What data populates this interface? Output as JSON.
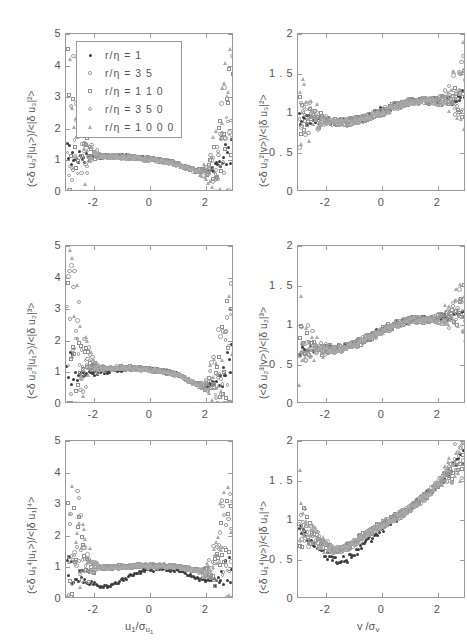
{
  "figure": {
    "title": "",
    "layout": "3 rows x 2 columns of scatter panels",
    "legend": {
      "position": "top-left panel, upper-left inside axes",
      "entries": [
        {
          "label": "r/η = 1",
          "marker": "filled-dot",
          "r_over_eta": 1
        },
        {
          "label": "r/η = 3 5",
          "marker": "small-circle",
          "r_over_eta": 35
        },
        {
          "label": "r/η = 1 1 0",
          "marker": "square",
          "r_over_eta": 110
        },
        {
          "label": "r/η = 3 5 0",
          "marker": "circle",
          "r_over_eta": 350
        },
        {
          "label": "r/η = 1 0 0 0",
          "marker": "triangle",
          "r_over_eta": 1000
        }
      ]
    },
    "colors": {
      "axis": "#9a9a9a",
      "text": "#555555",
      "series_1": "#3d3d3d",
      "series_35": "#8d8d8d",
      "series_110": "#909090",
      "series_350": "#a0a0a0",
      "series_1000": "#a8a8a8",
      "background": "#ffffff"
    }
  },
  "chart_data": [
    {
      "id": "panel-top-left",
      "type": "scatter",
      "title": "",
      "xlabel": "u₁/σ_u₁",
      "ylabel": "(<δ u₃²|u₁>)/<|δ u₃|²>",
      "xlim": [
        -3,
        3
      ],
      "ylim": [
        0,
        5
      ],
      "xticks": [
        -2,
        0,
        2
      ],
      "xticklabels": [
        "-2",
        "0",
        "2"
      ],
      "yticks": [
        0,
        1,
        2,
        3,
        4,
        5
      ],
      "yticklabels": [
        "0",
        "1",
        "2",
        "3",
        "4",
        "5"
      ],
      "grid": false,
      "description": "Flat near 1 across the core, dip to ~0.7 near x=2, upturn at both extreme tails."
    },
    {
      "id": "panel-top-right",
      "type": "scatter",
      "title": "",
      "xlabel": "v/σ_v",
      "ylabel": "(<δ u₃²|v>)/<|δ u₃|²>",
      "xlim": [
        -3,
        3
      ],
      "ylim": [
        0,
        2
      ],
      "xticks": [
        -2,
        0,
        2
      ],
      "xticklabels": [
        "-2",
        "0",
        "2"
      ],
      "yticks": [
        0,
        0.5,
        1,
        1.5,
        2
      ],
      "yticklabels": [
        "0",
        "0 . 5",
        "1",
        "1 . 5",
        "2"
      ],
      "grid": false,
      "description": "Monotonic rise from ~0.8 at x=-3 to ~1.4 at x=3."
    },
    {
      "id": "panel-middle-left",
      "type": "scatter",
      "title": "",
      "xlabel": "u₁/σ_u₁",
      "ylabel": "(<δ u₂³|u₁>)/<|δ u₂|³>",
      "xlim": [
        -3,
        3
      ],
      "ylim": [
        0,
        5
      ],
      "xticks": [
        -2,
        0,
        2
      ],
      "xticklabels": [
        "-2",
        "0",
        "2"
      ],
      "yticks": [
        0,
        1,
        2,
        3,
        4,
        5
      ],
      "yticklabels": [
        "0",
        "1",
        "2",
        "3",
        "4",
        "5"
      ],
      "grid": false,
      "description": "Near 1 in the core with a shallow dip to ~0.6 near x=2; strong scatter up to 4-5 at the left tail and up to 4 at the right tail."
    },
    {
      "id": "panel-middle-right",
      "type": "scatter",
      "title": "",
      "xlabel": "v/σ_v",
      "ylabel": "(<δ u₂³|v>)/<|δ u₂|³>",
      "xlim": [
        -3,
        3
      ],
      "ylim": [
        0,
        2
      ],
      "xticks": [
        -2,
        0,
        2
      ],
      "xticklabels": [
        "-2",
        "0",
        "2"
      ],
      "yticks": [
        0,
        0.5,
        1,
        1.5,
        2
      ],
      "yticklabels": [
        "0",
        "0 . 5",
        "1",
        "1 . 5",
        "2"
      ],
      "grid": false,
      "description": "Rises from ~0.6 at x=-3 through ~1.0 near x=0 to ~1.4 at x=3."
    },
    {
      "id": "panel-bottom-left",
      "type": "scatter",
      "title": "",
      "xlabel": "u₁/σ_u₁",
      "ylabel": "(<δ u₁⁴|u₁>)/<|δ u₁|⁴>",
      "xlim": [
        -3,
        3
      ],
      "ylim": [
        0,
        5
      ],
      "xticks": [
        -2,
        0,
        2
      ],
      "xticklabels": [
        "-2",
        "0",
        "2"
      ],
      "yticks": [
        0,
        1,
        2,
        3,
        4,
        5
      ],
      "yticklabels": [
        "0",
        "1",
        "2",
        "3",
        "4",
        "5"
      ],
      "grid": false,
      "description": "Plateau near 1 in the core; filled-dot series dips to ~0.35 near x=-1.7 and ~0.5 near x=2; large scatter 2-4.5 at the left tail."
    },
    {
      "id": "panel-bottom-right",
      "type": "scatter",
      "title": "",
      "xlabel": "v/σ_v",
      "ylabel": "(<δ u₁⁴|v>)/<|δ u₁|⁴>",
      "xlim": [
        -3,
        3
      ],
      "ylim": [
        0,
        2
      ],
      "xticks": [
        -2,
        0,
        2
      ],
      "xticklabels": [
        "-2",
        "0",
        "2"
      ],
      "yticks": [
        0,
        0.5,
        1,
        1.5,
        2
      ],
      "yticklabels": [
        "0",
        "0 . 5",
        "1",
        "1 . 5",
        "2"
      ],
      "grid": false,
      "description": "Dips to ~0.55 near x=-1.6 then rises steadily to ~1.7 at x=3."
    }
  ]
}
